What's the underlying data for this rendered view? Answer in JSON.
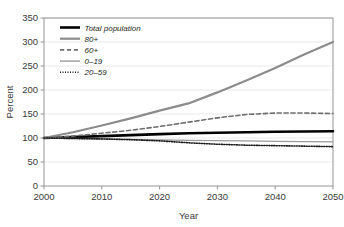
{
  "chart_data": {
    "type": "line",
    "title": "",
    "xlabel": "Year",
    "ylabel": "Percent",
    "xlim": [
      2000,
      2050
    ],
    "ylim": [
      0,
      350
    ],
    "ytick_step": 50,
    "xtick_step": 10,
    "grid": true,
    "legend_position": "top-left",
    "xticks": [
      "2000",
      "2010",
      "2020",
      "2030",
      "2040",
      "2050"
    ],
    "yticks": [
      "0",
      "50",
      "100",
      "150",
      "200",
      "250",
      "300",
      "350"
    ],
    "x": [
      2000,
      2005,
      2010,
      2015,
      2020,
      2025,
      2030,
      2035,
      2040,
      2045,
      2050
    ],
    "series": [
      {
        "name": "Total population",
        "style": "solid",
        "color": "#000000",
        "width": 2.6,
        "values": [
          100,
          102,
          104,
          106,
          108,
          110,
          111,
          112,
          113,
          113.5,
          114
        ]
      },
      {
        "name": "80+",
        "style": "solid",
        "color": "#8c8c8c",
        "width": 2.2,
        "values": [
          100,
          112,
          126,
          141,
          157,
          172,
          195,
          220,
          246,
          274,
          300
        ]
      },
      {
        "name": "60+",
        "style": "dashed",
        "color": "#6e6e6e",
        "width": 1.6,
        "values": [
          100,
          104,
          110,
          116,
          124,
          133,
          142,
          149,
          152,
          152,
          151
        ]
      },
      {
        "name": "0–19",
        "style": "solid",
        "color": "#9a9a9a",
        "width": 1.4,
        "values": [
          100,
          99,
          98,
          97,
          96,
          95,
          94.5,
          94,
          93,
          92.5,
          92
        ]
      },
      {
        "name": "20–59",
        "style": "dotted",
        "color": "#1a1a1a",
        "width": 1.6,
        "values": [
          100,
          99,
          98,
          96.5,
          94,
          90,
          87,
          85,
          84,
          83,
          82
        ]
      }
    ]
  },
  "legend": {
    "items": [
      {
        "label": "Total population"
      },
      {
        "label": "80+"
      },
      {
        "label": "60+"
      },
      {
        "label": "0–19"
      },
      {
        "label": "20–59"
      }
    ]
  },
  "colors": {
    "frame": "#8a8a8a",
    "grid": "#e3e3e3",
    "text": "#3a3a3a",
    "background": "#ffffff"
  }
}
